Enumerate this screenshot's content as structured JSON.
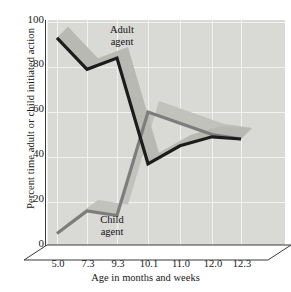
{
  "chart_data": {
    "type": "line",
    "title": "",
    "subtitle": "",
    "xlabel": "Age in months and weeks",
    "ylabel": "Percent time adult or child initiated action",
    "categories": [
      "5.0",
      "7.3",
      "9.3",
      "10.1",
      "11.0",
      "12.0",
      "12.3"
    ],
    "xtick_labels": [
      "5.0",
      "7.3",
      "9.3",
      "10.1",
      "11.0",
      "12.0",
      "12.3"
    ],
    "ytick_labels": [
      "0",
      "20",
      "40",
      "60",
      "80",
      "100"
    ],
    "yticks": [
      0,
      20,
      40,
      60,
      80,
      100
    ],
    "ylim": [
      0,
      100
    ],
    "grid": true,
    "legend_position": "inline-annotations",
    "style": "3d-ribbon",
    "series": [
      {
        "name": "Adult agent",
        "label": "Adult\nagent",
        "label_line1": "Adult",
        "label_line2": "agent",
        "color": "#1c1c1c",
        "ribbon_color": "#b9b9b3",
        "values": [
          93,
          79,
          84,
          37,
          45,
          49,
          48
        ]
      },
      {
        "name": "Child agent",
        "label": "Child\nagent",
        "label_line1": "Child",
        "label_line2": "agent",
        "color": "#7d7d7d",
        "ribbon_color": "#c2c2bc",
        "values": [
          6,
          16,
          14,
          60,
          55,
          50,
          48
        ]
      }
    ],
    "panel_background": "#d9d9d6",
    "gridline_color": "#f2f2ef",
    "axis_color": "#3b3b3b",
    "figure_background": "#ffffff"
  }
}
